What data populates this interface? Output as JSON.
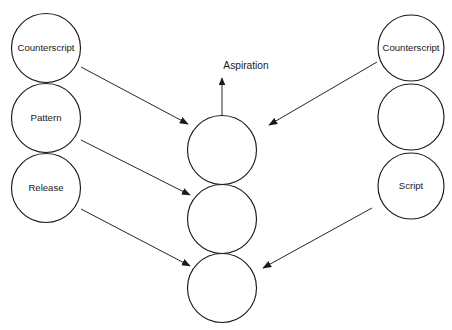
{
  "diagram": {
    "background_color": "#ffffff",
    "stroke_color": "#1a1a1a",
    "axis": {
      "label": "Aspiration",
      "label_x": 246,
      "label_y": 66,
      "line_x": 222,
      "line_top_y": 78,
      "line_bottom_y": 322,
      "arrow_direction": "up"
    },
    "columns": {
      "left": {
        "name": "left-column",
        "center_x": 46,
        "radius": 34.5,
        "nodes": [
          {
            "id": "left-counterscript",
            "label": "Counterscript",
            "cy": 48
          },
          {
            "id": "left-pattern",
            "label": "Pattern",
            "cy": 118
          },
          {
            "id": "left-release",
            "label": "Release",
            "cy": 188
          }
        ]
      },
      "center": {
        "name": "center-column",
        "center_x": 222,
        "radius": 34.5,
        "nodes": [
          {
            "id": "center-upper",
            "label": "",
            "cy": 150
          },
          {
            "id": "center-middle",
            "label": "",
            "cy": 219
          },
          {
            "id": "center-lower",
            "label": "",
            "cy": 288
          }
        ]
      },
      "right": {
        "name": "right-column",
        "center_x": 411,
        "radius": 33,
        "nodes": [
          {
            "id": "right-counterscript",
            "label": "Counterscript",
            "cy": 48
          },
          {
            "id": "right-blank",
            "label": "",
            "cy": 117
          },
          {
            "id": "right-script",
            "label": "Script",
            "cy": 186
          }
        ]
      }
    },
    "arrows": [
      {
        "id": "arrow-left-counterscript-to-center-upper",
        "from": "left-counterscript",
        "to": "center-upper",
        "x1": 81,
        "y1": 67,
        "x2": 188,
        "y2": 124
      },
      {
        "id": "arrow-left-pattern-to-center-middle",
        "from": "left-pattern",
        "to": "center-middle",
        "x1": 81,
        "y1": 140,
        "x2": 190,
        "y2": 195
      },
      {
        "id": "arrow-left-release-to-center-lower",
        "from": "left-release",
        "to": "center-lower",
        "x1": 81,
        "y1": 209,
        "x2": 190,
        "y2": 266
      },
      {
        "id": "arrow-right-counterscript-to-center-upper",
        "from": "right-counterscript",
        "to": "center-upper",
        "x1": 377,
        "y1": 62,
        "x2": 269,
        "y2": 125
      },
      {
        "id": "arrow-right-script-to-center-lower",
        "from": "right-script",
        "to": "center-lower",
        "x1": 372,
        "y1": 208,
        "x2": 263,
        "y2": 268
      }
    ]
  }
}
